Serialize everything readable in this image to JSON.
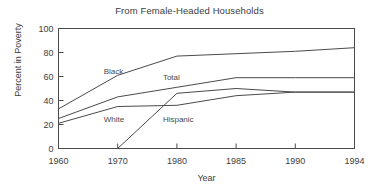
{
  "chart_data": {
    "type": "line",
    "title": "From Female-Headed Households",
    "xlabel": "Year",
    "ylabel": "Percent in Poverty",
    "categories": [
      "1960",
      "1970",
      "1980",
      "1985",
      "1990",
      "1994"
    ],
    "x_tick_labels": [
      "1960",
      "1970",
      "1980",
      "1985",
      "1990",
      "1994"
    ],
    "y_tick_labels": [
      "0",
      "20",
      "40",
      "60",
      "80",
      "100"
    ],
    "y_ticks": [
      0,
      20,
      40,
      60,
      80,
      100
    ],
    "ylim": [
      0,
      100
    ],
    "grid": false,
    "legend_position": "inline-labels",
    "series": [
      {
        "name": "Black",
        "label": "Black",
        "values": [
          33,
          61,
          77,
          79,
          81,
          84
        ]
      },
      {
        "name": "Total",
        "label": "Total",
        "values": [
          25,
          43,
          51,
          59,
          59,
          59
        ]
      },
      {
        "name": "White",
        "label": "White",
        "values": [
          21,
          35,
          36,
          44,
          47,
          47
        ]
      },
      {
        "name": "Hispanic",
        "label": "Hispanic",
        "values": [
          null,
          0,
          46,
          50,
          47,
          47
        ]
      }
    ],
    "annotations": [
      {
        "text": "Black",
        "x_category": "1970",
        "value": 62
      },
      {
        "text": "Total",
        "x_category": "1980",
        "value": 57
      },
      {
        "text": "White",
        "x_category": "1970",
        "value": 22
      },
      {
        "text": "Hispanic",
        "x_category": "1980",
        "value": 22
      }
    ]
  }
}
